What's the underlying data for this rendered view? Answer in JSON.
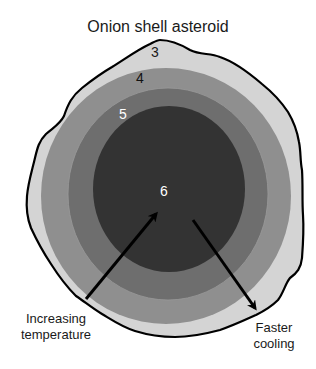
{
  "title": "Onion shell asteroid",
  "layers": [
    {
      "id": "3",
      "label": "3",
      "fill": "#d4d4d4",
      "label_color": "#1a1a1a"
    },
    {
      "id": "4",
      "label": "4",
      "fill": "#8f8f8f",
      "label_color": "#111111"
    },
    {
      "id": "5",
      "label": "5",
      "fill": "#6e6e6e",
      "label_color": "#ffffff"
    },
    {
      "id": "6",
      "label": "6",
      "fill": "#333333",
      "label_color": "#ffffff"
    }
  ],
  "arrows": [
    {
      "name": "increasing-temperature-arrow",
      "direction": "outer-to-core"
    },
    {
      "name": "faster-cooling-arrow",
      "direction": "core-to-outer"
    }
  ],
  "captions": {
    "increasing_temperature": {
      "line1": "Increasing",
      "line2": "temperature"
    },
    "faster_cooling": {
      "line1": "Faster",
      "line2": "cooling"
    }
  },
  "colors": {
    "outline": "#000000",
    "arrow": "#000000",
    "background": "#ffffff"
  }
}
